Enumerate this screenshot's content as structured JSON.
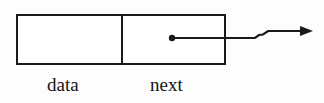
{
  "figure": {
    "kind": "linked-list-node-diagram",
    "colors": {
      "stroke": "#1a1a1a",
      "background": "#fdfdfd",
      "text": "#141414"
    },
    "node": {
      "box": {
        "x": 16,
        "y": 14,
        "width": 210,
        "height": 51
      },
      "divider_x": 122,
      "stroke_width": 2,
      "fields": [
        {
          "name": "data",
          "label": "data",
          "label_x": 47,
          "label_y": 75
        },
        {
          "name": "next",
          "label": "next",
          "label_x": 150,
          "label_y": 75
        }
      ]
    },
    "pointer": {
      "dot": {
        "cx": 172,
        "cy": 38,
        "r": 3
      },
      "line_y_start": 38,
      "line_y_end": 31,
      "kink_x_start": 255,
      "kink_x_end": 268,
      "arrow_tip_x": 313,
      "arrow_head_width": 13,
      "arrow_head_height": 9,
      "stroke_width": 2
    }
  }
}
